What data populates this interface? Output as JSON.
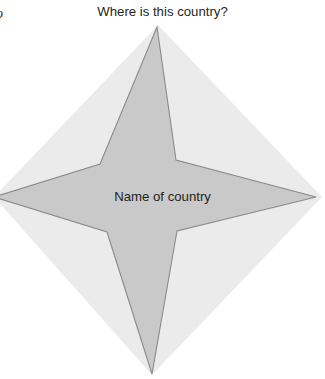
{
  "page": {
    "width": 325,
    "height": 379,
    "background_color": "#ffffff"
  },
  "folio": {
    "text": "o"
  },
  "title": {
    "text": "Where is this country?"
  },
  "figure": {
    "center_label": "Name of country",
    "halo": {
      "name": "diamond-halo",
      "fill_color": "#ebebeb",
      "points": "158,25 322,197 152,375 -6,197"
    },
    "star": {
      "name": "four-pointed-star",
      "fill_color": "#c9c9c9",
      "stroke_color": "#8a8a8a",
      "stroke_width": 1.1,
      "points": "157,27 176,160 316,197 177,231 152,374 107,232 -6,197 100,164"
    }
  }
}
